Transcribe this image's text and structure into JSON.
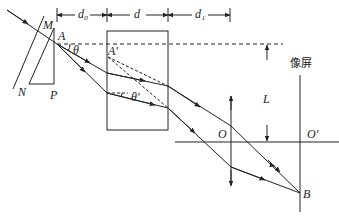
{
  "diagram": {
    "type": "optics",
    "labels": {
      "M": "M",
      "A": "A",
      "A_prime": "A′",
      "N": "N",
      "P": "P",
      "theta": "θ",
      "theta_prime": "θ′",
      "d0": "d₀",
      "d": "d",
      "d1": "d₁",
      "L": "L",
      "O": "O",
      "O_prime": "O′",
      "B": "B",
      "screen": "像屏"
    },
    "elements": [
      "mirror MN",
      "prism",
      "glass slab",
      "converging lens",
      "image screen",
      "optical axis"
    ],
    "dimensions": [
      "d0",
      "d",
      "d1",
      "L"
    ]
  }
}
